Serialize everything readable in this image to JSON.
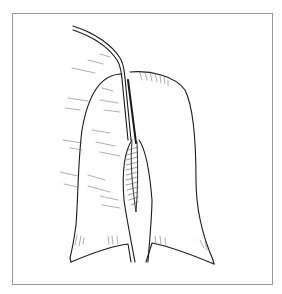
{
  "figure": {
    "type": "line-art illustration",
    "frame_color": "#9a9a9a",
    "stroke_color": "#1a1a1a",
    "hatch_color": "#555555",
    "background": "#ffffff",
    "elements": [
      "catheter-tube",
      "left-lobe",
      "right-lobe",
      "central-incision-hatched",
      "lower-flap-left",
      "lower-flap-right"
    ]
  }
}
